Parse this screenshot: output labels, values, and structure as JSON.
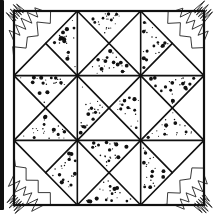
{
  "figure": {
    "grid": {
      "rows": 3,
      "cols": 3
    },
    "fills": {
      "dotted": "speckled fabric",
      "blank": "plain fabric",
      "zigzag": "zigzag hatched fabric"
    },
    "colors": {
      "line": "#111111",
      "background": "#ffffff"
    },
    "cells": [
      {
        "row": 0,
        "col": 0,
        "type": "corner",
        "diagonal": "bl-tr",
        "zigzag_half": "top-left",
        "split_triangles": {
          "right": "dotted",
          "bottom": "blank"
        }
      },
      {
        "row": 0,
        "col": 1,
        "type": "hourglass",
        "triangles": {
          "top": "dotted",
          "right": "blank",
          "bottom": "dotted",
          "left": "blank"
        }
      },
      {
        "row": 0,
        "col": 2,
        "type": "corner",
        "diagonal": "tl-br",
        "zigzag_half": "top-right",
        "split_triangles": {
          "left": "dotted",
          "bottom": "blank"
        }
      },
      {
        "row": 1,
        "col": 0,
        "type": "hourglass",
        "triangles": {
          "top": "dotted",
          "right": "blank",
          "bottom": "dotted",
          "left": "blank"
        }
      },
      {
        "row": 1,
        "col": 1,
        "type": "hourglass",
        "triangles": {
          "top": "blank",
          "right": "dotted",
          "bottom": "blank",
          "left": "dotted"
        }
      },
      {
        "row": 1,
        "col": 2,
        "type": "hourglass",
        "triangles": {
          "top": "dotted",
          "right": "blank",
          "bottom": "dotted",
          "left": "blank"
        }
      },
      {
        "row": 2,
        "col": 0,
        "type": "corner",
        "diagonal": "tl-br",
        "zigzag_half": "bottom-left",
        "split_triangles": {
          "top": "blank",
          "right": "dotted"
        }
      },
      {
        "row": 2,
        "col": 1,
        "type": "hourglass",
        "triangles": {
          "top": "dotted",
          "right": "blank",
          "bottom": "dotted",
          "left": "blank"
        }
      },
      {
        "row": 2,
        "col": 2,
        "type": "corner",
        "diagonal": "bl-tr",
        "zigzag_half": "bottom-right",
        "split_triangles": {
          "top": "blank",
          "left": "dotted"
        }
      }
    ]
  }
}
